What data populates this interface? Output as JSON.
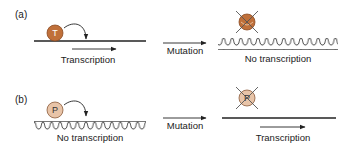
{
  "panels": [
    {
      "label": "(a)",
      "before": {
        "dna_state": "relaxed (straight line)",
        "protein": {
          "letter": "T",
          "fill": "#c0703a",
          "stroke": "#8a4a22",
          "text_color": "#ffffff"
        },
        "caption": "Transcription",
        "has_transcription_arrow": true
      },
      "arrow_label": "Mutation",
      "after": {
        "dna_state": "coiled",
        "protein": {
          "letter": "",
          "fill": "#c0703a",
          "stroke": "#8a4a22",
          "crossed_out": true
        },
        "caption": "No transcription",
        "has_transcription_arrow": false
      }
    },
    {
      "label": "(b)",
      "before": {
        "dna_state": "coiled",
        "protein": {
          "letter": "P",
          "fill": "#e8c4a8",
          "stroke": "#8a5a3a",
          "text_color": "#333333"
        },
        "caption": "No transcription",
        "has_transcription_arrow": false
      },
      "arrow_label": "Mutation",
      "after": {
        "dna_state": "relaxed (straight line)",
        "protein": {
          "letter": "P",
          "fill": "#e8c4a8",
          "stroke": "#8a5a3a",
          "crossed_out": true
        },
        "caption": "Transcription",
        "has_transcription_arrow": true
      }
    }
  ],
  "colors": {
    "line": "#222222",
    "cross": "#555555"
  }
}
